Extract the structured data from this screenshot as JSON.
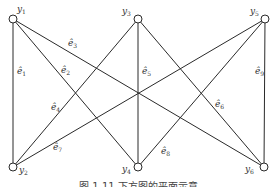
{
  "diagram": {
    "type": "bipartite-graph",
    "nodes": [
      {
        "id": "y1",
        "label": "y",
        "sub": "1",
        "x": 13,
        "y": 19,
        "lx": 17,
        "ly": 12
      },
      {
        "id": "y2",
        "label": "y",
        "sub": "2",
        "x": 13,
        "y": 167,
        "lx": 19,
        "ly": 173
      },
      {
        "id": "y3",
        "label": "y",
        "sub": "3",
        "x": 138,
        "y": 19,
        "lx": 122,
        "ly": 14
      },
      {
        "id": "y4",
        "label": "y",
        "sub": "4",
        "x": 138,
        "y": 167,
        "lx": 122,
        "ly": 172
      },
      {
        "id": "y5",
        "label": "y",
        "sub": "5",
        "x": 265,
        "y": 19,
        "lx": 250,
        "ly": 14
      },
      {
        "id": "y6",
        "label": "y",
        "sub": "6",
        "x": 264,
        "y": 167,
        "lx": 245,
        "ly": 172
      }
    ],
    "edges": [
      {
        "id": "e1",
        "label": "ê",
        "sub": "1",
        "from": "y1",
        "to": "y2",
        "lx": 17,
        "ly": 74
      },
      {
        "id": "e2",
        "label": "ê",
        "sub": "2",
        "from": "y1",
        "to": "y4",
        "lx": 61,
        "ly": 73
      },
      {
        "id": "e3",
        "label": "ê",
        "sub": "3",
        "from": "y1",
        "to": "y6",
        "lx": 68,
        "ly": 46
      },
      {
        "id": "e4",
        "label": "ê",
        "sub": "4",
        "from": "y3",
        "to": "y2",
        "lx": 51,
        "ly": 110
      },
      {
        "id": "e5",
        "label": "ê",
        "sub": "5",
        "from": "y3",
        "to": "y4",
        "lx": 142,
        "ly": 74
      },
      {
        "id": "e6",
        "label": "ê",
        "sub": "6",
        "from": "y3",
        "to": "y6",
        "lx": 215,
        "ly": 107
      },
      {
        "id": "e7",
        "label": "ê",
        "sub": "7",
        "from": "y5",
        "to": "y2",
        "lx": 53,
        "ly": 150
      },
      {
        "id": "e8",
        "label": "ê",
        "sub": "8",
        "from": "y5",
        "to": "y4",
        "lx": 161,
        "ly": 154
      },
      {
        "id": "e9",
        "label": "ê",
        "sub": "9",
        "from": "y5",
        "to": "y6",
        "lx": 255,
        "ly": 74
      }
    ]
  },
  "caption": "图 1.11   下方图的平面示意"
}
